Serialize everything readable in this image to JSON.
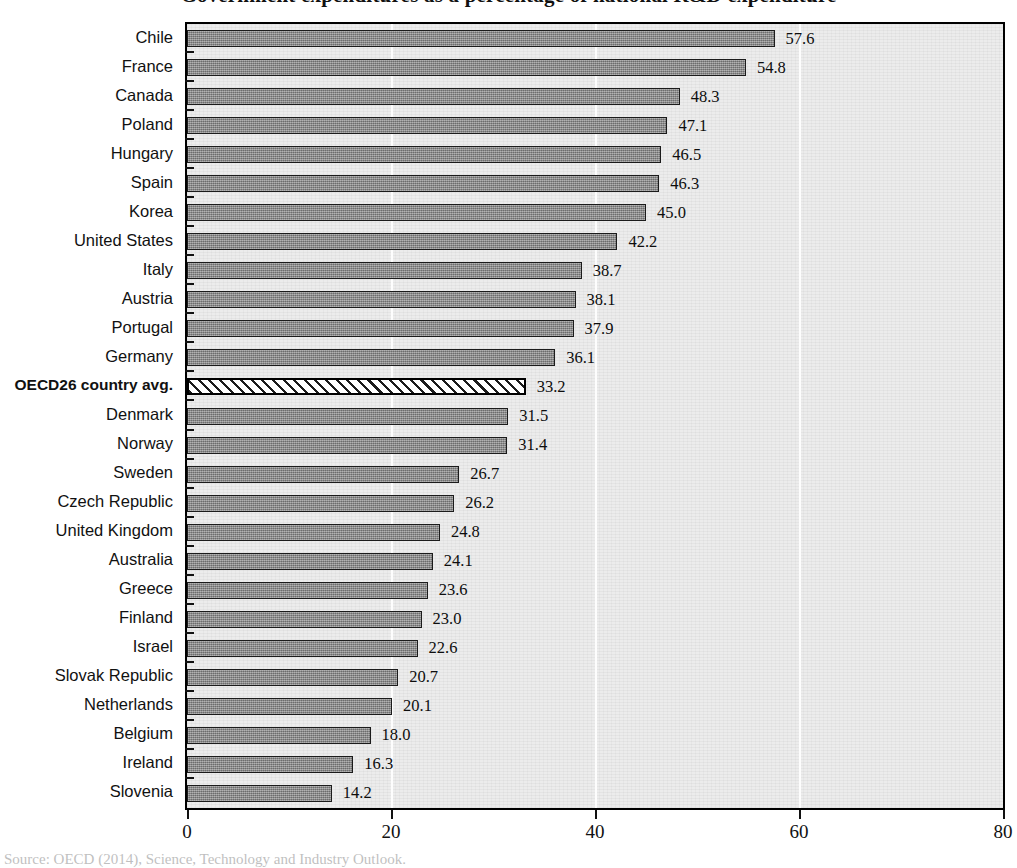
{
  "chart_data": {
    "type": "bar",
    "orientation": "horizontal",
    "title": "Government expenditures as a percentage of national R&D expenditure",
    "xlabel": "",
    "ylabel": "",
    "xlim": [
      0,
      80
    ],
    "xticks": [
      0,
      20,
      40,
      60,
      80
    ],
    "grid": true,
    "legend": "none",
    "categories": [
      "Chile",
      "France",
      "Canada",
      "Poland",
      "Hungary",
      "Spain",
      "Korea",
      "United States",
      "Italy",
      "Austria",
      "Portugal",
      "Germany",
      "OECD26 country avg.",
      "Denmark",
      "Norway",
      "Sweden",
      "Czech Republic",
      "United Kingdom",
      "Australia",
      "Greece",
      "Finland",
      "Israel",
      "Slovak Republic",
      "Netherlands",
      "Belgium",
      "Ireland",
      "Slovenia"
    ],
    "values": [
      57.6,
      54.8,
      48.3,
      47.1,
      46.5,
      46.3,
      45.0,
      42.2,
      38.7,
      38.1,
      37.9,
      36.1,
      33.2,
      31.5,
      31.4,
      26.7,
      26.2,
      24.8,
      24.1,
      23.6,
      23.0,
      22.6,
      20.7,
      20.1,
      18.0,
      16.3,
      14.2
    ],
    "value_labels": [
      "57.6",
      "54.8",
      "48.3",
      "47.1",
      "46.5",
      "46.3",
      "45.0",
      "42.2",
      "38.7",
      "38.1",
      "37.9",
      "36.1",
      "33.2",
      "31.5",
      "31.4",
      "26.7",
      "26.2",
      "24.8",
      "24.1",
      "23.6",
      "23.0",
      "22.6",
      "20.7",
      "20.1",
      "18.0",
      "16.3",
      "14.2"
    ],
    "highlight_index": 12,
    "highlight_style": "diagonal-hatch",
    "bar_color": "#8d8d8d",
    "bar_edge_color": "#1b1b1b",
    "highlight_color": "#ffffff",
    "plot_background": "#ececec",
    "gridline_color": "#fdfdfd"
  },
  "source_note": "Source: OECD (2014), Science, Technology and Industry Outlook."
}
